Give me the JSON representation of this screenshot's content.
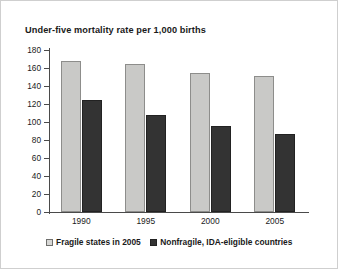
{
  "chart_data": {
    "type": "bar",
    "title": "Under-five mortality rate per 1,000 births",
    "xlabel": "",
    "ylabel": "",
    "categories": [
      "1990",
      "1995",
      "2000",
      "2005"
    ],
    "series": [
      {
        "name": "Fragile states in 2005",
        "color": "#c9c9c7",
        "values": [
          168,
          165,
          155,
          151
        ]
      },
      {
        "name": "Nonfragile, IDA-eligible countries",
        "color": "#333333",
        "values": [
          124,
          108,
          96,
          87
        ]
      }
    ],
    "ylim": [
      0,
      180
    ],
    "yticks": [
      0,
      20,
      40,
      60,
      80,
      100,
      120,
      140,
      160,
      180
    ],
    "ytick_labels": [
      "0",
      "20",
      "40",
      "60",
      "80",
      "100",
      "120",
      "140",
      "160",
      "180"
    ],
    "grid": false,
    "legend_position": "bottom"
  },
  "legend": {
    "entries": [
      {
        "label": "Fragile states in 2005",
        "swatch": "light-square-icon"
      },
      {
        "label": "Nonfragile, IDA-eligible countries",
        "swatch": "dark-square-icon"
      }
    ]
  }
}
